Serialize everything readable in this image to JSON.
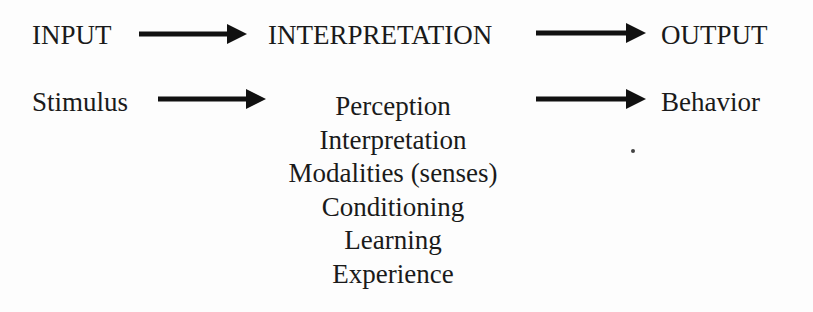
{
  "header_row": {
    "input": "INPUT",
    "interpretation": "INTERPRETATION",
    "output": "OUTPUT"
  },
  "detail_row": {
    "stimulus": "Stimulus",
    "behavior": "Behavior",
    "interpretation_items": [
      "Perception",
      "Interpretation",
      "Modalities (senses)",
      "Conditioning",
      "Learning",
      "Experience"
    ]
  },
  "icons": [
    "arrow-right-icon"
  ]
}
